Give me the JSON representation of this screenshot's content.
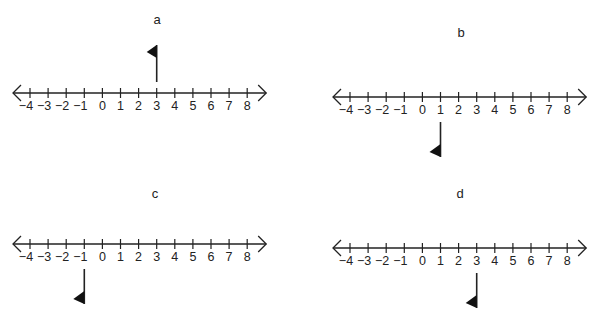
{
  "panels": [
    {
      "id": "a",
      "label": "a",
      "axis_y": 93,
      "x0": 30,
      "spacing": 18.1,
      "flag_value": 3,
      "flag_direction": "up",
      "label_pos": [
        157,
        12
      ]
    },
    {
      "id": "b",
      "label": "b",
      "axis_y": 97,
      "x0": 350,
      "spacing": 18.1,
      "flag_value": 1,
      "flag_direction": "down",
      "label_pos": [
        461,
        25
      ]
    },
    {
      "id": "c",
      "label": "c",
      "axis_y": 244,
      "x0": 30,
      "spacing": 18.1,
      "flag_value": -1,
      "flag_direction": "down",
      "label_pos": [
        155,
        186
      ]
    },
    {
      "id": "d",
      "label": "d",
      "axis_y": 248,
      "x0": 350,
      "spacing": 18.1,
      "flag_value": 3,
      "flag_direction": "down",
      "label_pos": [
        460,
        186
      ]
    }
  ],
  "ticks": [
    -4,
    -3,
    -2,
    -1,
    0,
    1,
    2,
    3,
    4,
    5,
    6,
    7,
    8
  ],
  "tick_labels": [
    "−4",
    "−3",
    "−2",
    "−1",
    "0",
    "1",
    "2",
    "3",
    "4",
    "5",
    "6",
    "7",
    "8"
  ],
  "colors": {
    "line": "#222222",
    "flag": "#111111"
  }
}
